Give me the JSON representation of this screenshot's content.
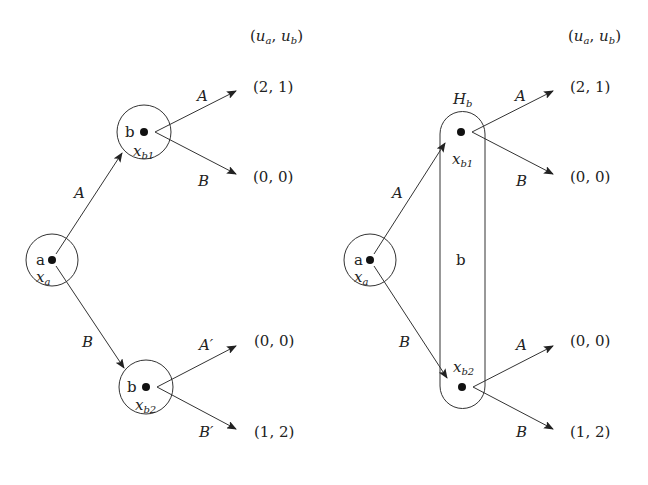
{
  "left_tree": {
    "payoff_header": "(u_a, u_b)",
    "root": {
      "player": "a",
      "label": "x",
      "sub": "a"
    },
    "node_b1": {
      "player": "b",
      "label": "x",
      "sub": "b1"
    },
    "node_b2": {
      "player": "b",
      "label": "x",
      "sub": "b2"
    },
    "edge_root_b1": "A",
    "edge_root_b2": "B",
    "b1_actions": [
      "A",
      "B"
    ],
    "b2_actions": [
      "A′",
      "B′"
    ],
    "payoffs": [
      "(2, 1)",
      "(0, 0)",
      "(0, 0)",
      "(1, 2)"
    ]
  },
  "right_tree": {
    "payoff_header": "(u_a, u_b)",
    "root": {
      "player": "a",
      "label": "x",
      "sub": "a"
    },
    "info_set": {
      "label": "H",
      "sub": "b",
      "player": "b"
    },
    "node_b1": {
      "label": "x",
      "sub": "b1"
    },
    "node_b2": {
      "label": "x",
      "sub": "b2"
    },
    "edge_root_b1": "A",
    "edge_root_b2": "B",
    "b1_actions": [
      "A",
      "B"
    ],
    "b2_actions": [
      "A",
      "B"
    ],
    "payoffs": [
      "(2, 1)",
      "(0, 0)",
      "(0, 0)",
      "(1, 2)"
    ]
  },
  "header_parts": {
    "open": "(",
    "u": "u",
    "a": "a",
    "comma": ", ",
    "b": "b",
    "close": ")"
  }
}
